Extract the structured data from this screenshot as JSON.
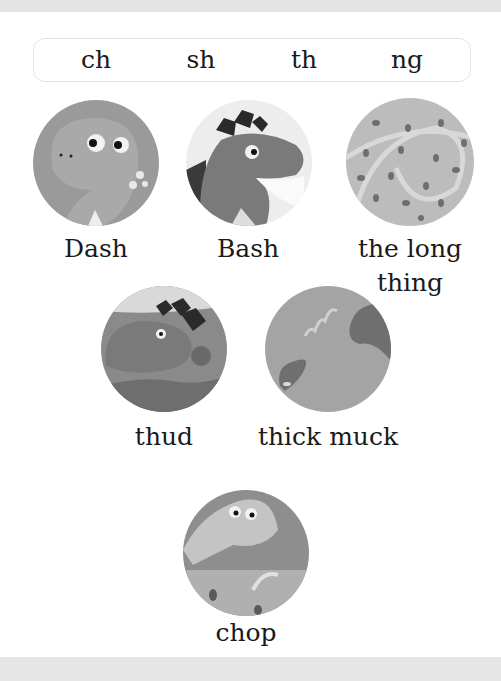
{
  "letter_sounds": [
    "ch",
    "sh",
    "th",
    "ng"
  ],
  "pictures": [
    {
      "id": "dash",
      "label": "Dash"
    },
    {
      "id": "bash",
      "label": "Bash"
    },
    {
      "id": "long-thing",
      "label_line1": "the long",
      "label_line2": "thing"
    },
    {
      "id": "thud",
      "label": "thud"
    },
    {
      "id": "thick-muck",
      "label": "thick muck"
    },
    {
      "id": "chop",
      "label": "chop"
    }
  ]
}
